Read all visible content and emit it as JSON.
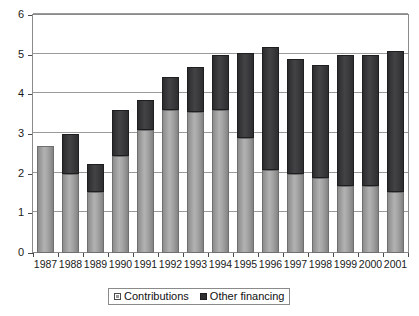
{
  "chart_data": {
    "type": "bar",
    "stacked": true,
    "title": "",
    "subtitle": "",
    "xlabel": "",
    "ylabel": "",
    "ylim": [
      0,
      6
    ],
    "yticks": [
      0,
      1,
      2,
      3,
      4,
      5,
      6
    ],
    "ytick_labels": [
      "0",
      "1",
      "2",
      "3",
      "4",
      "5",
      "6"
    ],
    "grid": true,
    "grid_axis": "y",
    "legend_position": "bottom-center",
    "categories": [
      "1987",
      "1988",
      "1989",
      "1990",
      "1991",
      "1992",
      "1993",
      "1994",
      "1995",
      "1996",
      "1997",
      "1998",
      "1999",
      "2000",
      "2001"
    ],
    "series": [
      {
        "name": "Contributions",
        "color": "#9a9a9a",
        "values": [
          2.7,
          2.0,
          1.55,
          2.45,
          3.1,
          3.6,
          3.55,
          3.6,
          2.9,
          2.1,
          2.0,
          1.9,
          1.7,
          1.7,
          1.55
        ]
      },
      {
        "name": "Other financing",
        "color": "#33333600",
        "values": [
          0.0,
          1.0,
          0.7,
          1.15,
          0.75,
          0.85,
          1.15,
          1.4,
          2.15,
          3.1,
          2.9,
          2.85,
          3.3,
          3.3,
          3.55
        ]
      }
    ],
    "totals": [
      2.7,
      3.0,
      2.25,
      3.6,
      3.85,
      4.45,
      4.7,
      5.0,
      5.05,
      5.2,
      4.9,
      4.75,
      5.0,
      5.0,
      5.1
    ]
  },
  "legend": {
    "items": [
      {
        "label": "Contributions",
        "swatch": "contributions-swatch"
      },
      {
        "label": "Other financing",
        "swatch": "other-financing-swatch"
      }
    ]
  },
  "colors": {
    "contributions": "#9a9a9a",
    "other_financing": "#333336",
    "gridline": "#9a9a9a",
    "axis": "#4a4a4a",
    "text": "#1a1a1a",
    "background": "#ffffff"
  }
}
